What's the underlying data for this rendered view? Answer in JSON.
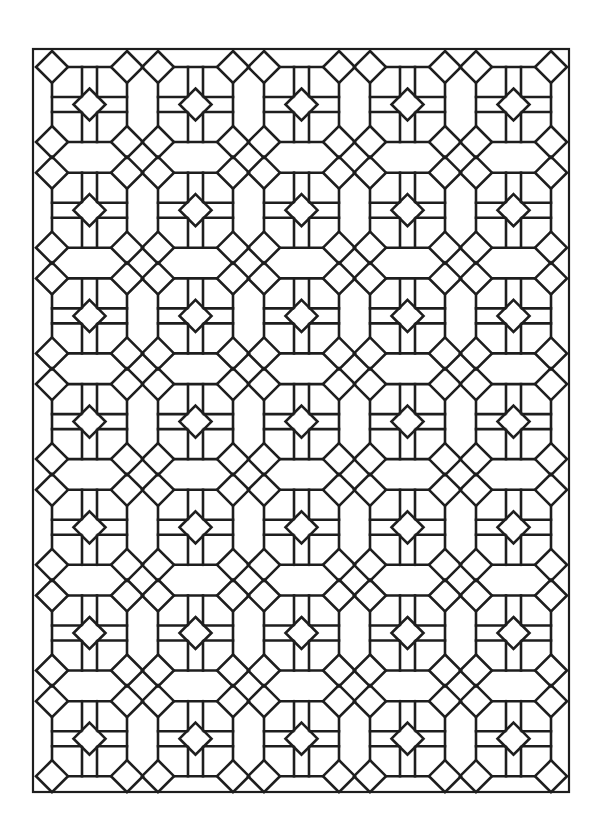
{
  "page": {
    "width": 605,
    "height": 828,
    "background": "#ffffff"
  },
  "pattern": {
    "name": "geometric-tile-coloring-page",
    "stroke_color": "#1e1e1e",
    "stroke_width": 2.6,
    "border": {
      "x": 33,
      "y": 49,
      "width": 536,
      "height": 743,
      "stroke_width": 2.2
    },
    "grid": {
      "columns": 5,
      "rows": 7,
      "origin_x": 52,
      "origin_y": 67,
      "pitch_x": 106,
      "pitch_y": 105.7
    },
    "tile": {
      "size": 75,
      "corner_diamond_radius": 16,
      "center_diamond_radius": 16,
      "inner_vertical_lines": [
        30,
        45
      ],
      "inner_horizontal_lines": [
        30,
        45
      ]
    }
  }
}
